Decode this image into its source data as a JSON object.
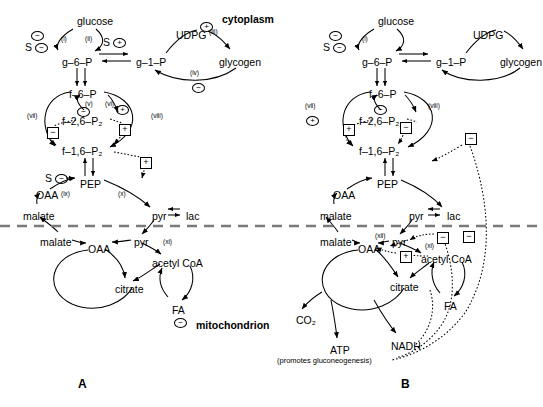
{
  "figure": {
    "panels": [
      {
        "id": "A",
        "label": "A",
        "label_x": 78,
        "label_y": 378
      },
      {
        "id": "B",
        "label": "B",
        "label_x": 401,
        "label_y": 378
      }
    ],
    "compartments": [
      {
        "name": "cytoplasm",
        "text": "cytoplasm",
        "x": 222,
        "y": 14
      },
      {
        "name": "mitochondrion",
        "text": "mitochondrion",
        "x": 196,
        "y": 320
      }
    ]
  },
  "panelA": {
    "metabolites": [
      {
        "name": "glucose",
        "text": "glucose",
        "x": 77,
        "y": 16
      },
      {
        "name": "g-6-P",
        "text": "g–6–P",
        "x": 62,
        "y": 57
      },
      {
        "name": "g-1-P",
        "text": "g–1–P",
        "x": 136,
        "y": 57
      },
      {
        "name": "UDPG",
        "text": "UDPG",
        "x": 176,
        "y": 30
      },
      {
        "name": "glycogen",
        "text": "glycogen",
        "x": 219,
        "y": 57
      },
      {
        "name": "f-6-P",
        "text": "f–6–P",
        "x": 69,
        "y": 89
      },
      {
        "name": "f-2,6-P2",
        "text": "f–2,6–P₂",
        "x": 62,
        "y": 116
      },
      {
        "name": "f-1,6-P2",
        "text": "f–1,6–P₂",
        "x": 62,
        "y": 146
      },
      {
        "name": "PEP",
        "text": "PEP",
        "x": 80,
        "y": 179
      },
      {
        "name": "OAA-cyt",
        "text": "OAA",
        "x": 36,
        "y": 190
      },
      {
        "name": "malate-cyt",
        "text": "malate",
        "x": 23,
        "y": 211
      },
      {
        "name": "pyr-cyt",
        "text": "pyr",
        "x": 152,
        "y": 211
      },
      {
        "name": "lac",
        "text": "lac",
        "x": 186,
        "y": 211
      },
      {
        "name": "malate-mit",
        "text": "malate",
        "x": 40,
        "y": 237
      },
      {
        "name": "OAA-mit",
        "text": "OAA",
        "x": 88,
        "y": 244
      },
      {
        "name": "pyr-mit",
        "text": "pyr",
        "x": 134,
        "y": 237
      },
      {
        "name": "acetyl-CoA",
        "text": "acetyl CoA",
        "x": 152,
        "y": 258
      },
      {
        "name": "citrate",
        "text": "citrate",
        "x": 115,
        "y": 284
      },
      {
        "name": "FA",
        "text": "FA",
        "x": 172,
        "y": 305
      }
    ],
    "steps": [
      {
        "name": "step-i",
        "text": "(i)",
        "x": 61,
        "y": 36
      },
      {
        "name": "step-ii",
        "text": "(ii)",
        "x": 85,
        "y": 36
      },
      {
        "name": "step-iii",
        "text": "(iii)",
        "x": 209,
        "y": 29
      },
      {
        "name": "step-iv",
        "text": "(iv)",
        "x": 190,
        "y": 70
      },
      {
        "name": "step-v",
        "text": "(v)",
        "x": 85,
        "y": 101
      },
      {
        "name": "step-vi",
        "text": "(vi)",
        "x": 105,
        "y": 101
      },
      {
        "name": "step-vii",
        "text": "(vii)",
        "x": 27,
        "y": 113
      },
      {
        "name": "step-viii",
        "text": "(viii)",
        "x": 151,
        "y": 113
      },
      {
        "name": "step-ix",
        "text": "(ix)",
        "x": 61,
        "y": 191
      },
      {
        "name": "step-x",
        "text": "(x)",
        "x": 118,
        "y": 191
      },
      {
        "name": "step-xi",
        "text": "(xi)",
        "x": 163,
        "y": 239
      }
    ],
    "modulators": [
      {
        "name": "mod-minus-glucose",
        "glyph": "−",
        "shape": "circle",
        "x": 31,
        "y": 31
      },
      {
        "name": "mod-S-minus-glucose",
        "glyph": "−",
        "shape": "circle",
        "prefix": "S",
        "x": 35,
        "y": 43
      },
      {
        "name": "mod-S-plus-g6p",
        "glyph": "+",
        "shape": "circle",
        "prefix": "S",
        "x": 113,
        "y": 38
      },
      {
        "name": "mod-plus-udpg",
        "glyph": "+",
        "shape": "circle",
        "x": 200,
        "y": 22
      },
      {
        "name": "mod-minus-glycogen",
        "glyph": "−",
        "shape": "circle",
        "x": 192,
        "y": 83
      },
      {
        "name": "mod-minus-f26",
        "glyph": "−",
        "shape": "circle",
        "x": 77,
        "y": 107
      },
      {
        "name": "mod-plus-f26",
        "glyph": "+",
        "shape": "circle",
        "x": 116,
        "y": 105
      },
      {
        "name": "mod-box-minus-left",
        "glyph": "−",
        "shape": "square",
        "x": 47,
        "y": 127
      },
      {
        "name": "mod-box-plus-right",
        "glyph": "+",
        "shape": "square",
        "x": 119,
        "y": 124
      },
      {
        "name": "mod-box-plus-f16",
        "glyph": "+",
        "shape": "square",
        "x": 140,
        "y": 157
      },
      {
        "name": "mod-S-minus-pep",
        "glyph": "−",
        "shape": "circle",
        "prefix": "S",
        "x": 55,
        "y": 174
      },
      {
        "name": "mod-minus-FA",
        "glyph": "−",
        "shape": "circle",
        "x": 174,
        "y": 318
      }
    ]
  },
  "panelB": {
    "metabolites": [
      {
        "name": "glucose",
        "text": "glucose",
        "x": 378,
        "y": 16
      },
      {
        "name": "g-6-P",
        "text": "g–6–P",
        "x": 362,
        "y": 57
      },
      {
        "name": "g-1-P",
        "text": "g–1–P",
        "x": 436,
        "y": 57
      },
      {
        "name": "UDPG",
        "text": "UDPG",
        "x": 473,
        "y": 30
      },
      {
        "name": "glycogen",
        "text": "glycogen",
        "x": 500,
        "y": 57
      },
      {
        "name": "f-6-P",
        "text": "f–6–P",
        "x": 369,
        "y": 89
      },
      {
        "name": "f-2,6-P2",
        "text": "f–2,6–P₂",
        "x": 359,
        "y": 116
      },
      {
        "name": "f-1,6-P2",
        "text": "f–1,6–P₂",
        "x": 359,
        "y": 146
      },
      {
        "name": "PEP",
        "text": "PEP",
        "x": 377,
        "y": 179
      },
      {
        "name": "OAA-cyt",
        "text": "OAA",
        "x": 333,
        "y": 190
      },
      {
        "name": "malate-cyt",
        "text": "malate",
        "x": 320,
        "y": 211
      },
      {
        "name": "pyr-cyt",
        "text": "pyr",
        "x": 409,
        "y": 211
      },
      {
        "name": "lac",
        "text": "lac",
        "x": 447,
        "y": 211
      },
      {
        "name": "malate-mit",
        "text": "malate",
        "x": 320,
        "y": 237
      },
      {
        "name": "OAA-mit",
        "text": "OAA",
        "x": 358,
        "y": 244
      },
      {
        "name": "pyr-mit",
        "text": "pyr",
        "x": 392,
        "y": 237
      },
      {
        "name": "acetyl-CoA",
        "text": "acetyl CoA",
        "x": 421,
        "y": 254
      },
      {
        "name": "citrate",
        "text": "citrate",
        "x": 390,
        "y": 282
      },
      {
        "name": "FA",
        "text": "FA",
        "x": 444,
        "y": 301
      },
      {
        "name": "CO2",
        "text": "CO₂",
        "x": 296,
        "y": 315
      },
      {
        "name": "ATP",
        "text": "ATP",
        "x": 330,
        "y": 345
      },
      {
        "name": "NADH",
        "text": "NADH",
        "x": 391,
        "y": 341
      }
    ],
    "steps": [
      {
        "name": "step-i",
        "text": "(i)",
        "x": 362,
        "y": 36
      },
      {
        "name": "step-vii",
        "text": "(vii)",
        "x": 305,
        "y": 103
      },
      {
        "name": "step-viii",
        "text": "(viii)",
        "x": 428,
        "y": 103
      },
      {
        "name": "step-xii",
        "text": "(xii)",
        "x": 375,
        "y": 233
      },
      {
        "name": "step-xi",
        "text": "(xi)",
        "x": 425,
        "y": 243
      }
    ],
    "modulators": [
      {
        "name": "mod-minus-glucose",
        "glyph": "−",
        "shape": "circle",
        "x": 329,
        "y": 31
      },
      {
        "name": "mod-S-minus-glucose",
        "glyph": "−",
        "shape": "circle",
        "prefix": "S",
        "x": 333,
        "y": 43
      },
      {
        "name": "mod-plus-vii",
        "glyph": "+",
        "shape": "circle",
        "x": 306,
        "y": 116
      },
      {
        "name": "mod-minus-f26",
        "glyph": "−",
        "shape": "circle",
        "x": 374,
        "y": 105
      },
      {
        "name": "mod-box-plus-left",
        "glyph": "+",
        "shape": "square",
        "x": 343,
        "y": 124
      },
      {
        "name": "mod-box-minus-right",
        "glyph": "−",
        "shape": "square",
        "x": 400,
        "y": 122
      },
      {
        "name": "mod-box-minus-far",
        "glyph": "−",
        "shape": "square",
        "x": 465,
        "y": 133
      },
      {
        "name": "mod-box-minus-mit1",
        "glyph": "−",
        "shape": "square",
        "x": 437,
        "y": 232
      },
      {
        "name": "mod-box-minus-mit2",
        "glyph": "−",
        "shape": "square",
        "x": 463,
        "y": 231
      },
      {
        "name": "mod-box-plus-mit",
        "glyph": "+",
        "shape": "square",
        "x": 400,
        "y": 251
      }
    ],
    "notes": [
      {
        "name": "atp-note",
        "text": "(promotes gluconeogenesis)",
        "x": 277,
        "y": 357
      }
    ]
  }
}
